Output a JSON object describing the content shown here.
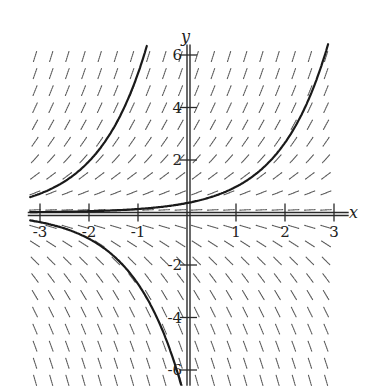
{
  "chart_data": {
    "type": "line",
    "subtype": "direction-field",
    "title": "",
    "xlabel": "x",
    "ylabel": "y",
    "equation_estimate": "dy/dx = y",
    "xlim": [
      -3.2,
      3.2
    ],
    "ylim": [
      -6.6,
      6.6
    ],
    "grid": false,
    "legend": null,
    "x_ticks": [
      -3,
      -2,
      -1,
      1,
      2,
      3
    ],
    "x_tick_labels": [
      "-3",
      "-2",
      "-1",
      "1",
      "2",
      "3"
    ],
    "y_ticks": [
      -6,
      -4,
      -2,
      2,
      4,
      6
    ],
    "y_tick_labels": [
      "-6",
      "-4",
      "-2",
      "2",
      "4",
      "6"
    ],
    "slope_field": {
      "x_step": 0.33,
      "y_step": 0.65,
      "x_range": [
        -3.1,
        3.1
      ],
      "y_range": [
        -6.4,
        6.4
      ]
    },
    "series": [
      {
        "name": "solution-upper-right",
        "formula_estimate": "y = 0.36 e^x",
        "x": [
          -3.2,
          -2,
          -1,
          0,
          0.88,
          1.69,
          2.31,
          2.85
        ],
        "y": [
          0.015,
          0.05,
          0.13,
          0.36,
          0.86,
          2.0,
          3.33,
          6.2
        ]
      },
      {
        "name": "solution-upper-left",
        "formula_estimate": "y = 14.4 e^x",
        "x": [
          -3.2,
          -2.53,
          -2.0,
          -1.5,
          -1.0,
          -0.86
        ],
        "y": [
          0.59,
          0.93,
          1.95,
          3.2,
          5.3,
          6.1
        ]
      },
      {
        "name": "solution-lower",
        "formula_estimate": "y = -7.4 e^x",
        "x": [
          -3.2,
          -2.04,
          -1.06,
          -0.45,
          -0.04
        ],
        "y": [
          -0.3,
          -0.97,
          -2.27,
          -3.9,
          -6.4
        ]
      }
    ]
  },
  "labels": {
    "x_axis": "x",
    "y_axis": "y"
  }
}
